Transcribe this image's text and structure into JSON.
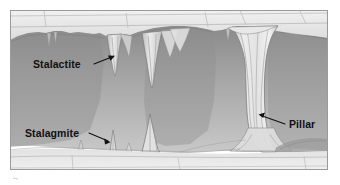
{
  "figure": {
    "background_color": "#ffffff",
    "frame": {
      "x": 10,
      "y": 10,
      "width": 318,
      "height": 160,
      "border_color": "#9a9a9a"
    }
  },
  "palette": {
    "rock_light": "#e9e9e9",
    "rock_mid": "#dcdcdc",
    "rock_line": "#b4b4b4",
    "cave_dark": "#8f8f8f",
    "cave_mid": "#a8a8a8",
    "cave_light": "#c6c6c6",
    "formation_light": "#e4e4e4",
    "formation_line": "#8a8a8a",
    "floor": "#d8d8d8",
    "label_color": "#111111"
  },
  "labels": [
    {
      "id": "stalactite",
      "text": "Stalactite",
      "text_x": 33,
      "text_y": 68,
      "anchor": "start",
      "leader": "M 94 64 L 114 56",
      "arrow_x": 115,
      "arrow_y": 55.5,
      "arrow_rot": 338
    },
    {
      "id": "stalagmite",
      "text": "Stalagmite",
      "text_x": 25,
      "text_y": 138,
      "anchor": "start",
      "leader": "M 89 134 L 110 142",
      "arrow_x": 111,
      "arrow_y": 142.5,
      "arrow_rot": 20
    },
    {
      "id": "pillar",
      "text": "Pillar",
      "text_x": 288,
      "text_y": 128,
      "anchor": "start",
      "leader": "M 284 124 L 259 115",
      "arrow_x": 258,
      "arrow_y": 114.5,
      "arrow_rot": 200
    }
  ],
  "formations": {
    "stalactites_count": 6,
    "stalagmites_count": 4,
    "pillars_count": 1
  }
}
